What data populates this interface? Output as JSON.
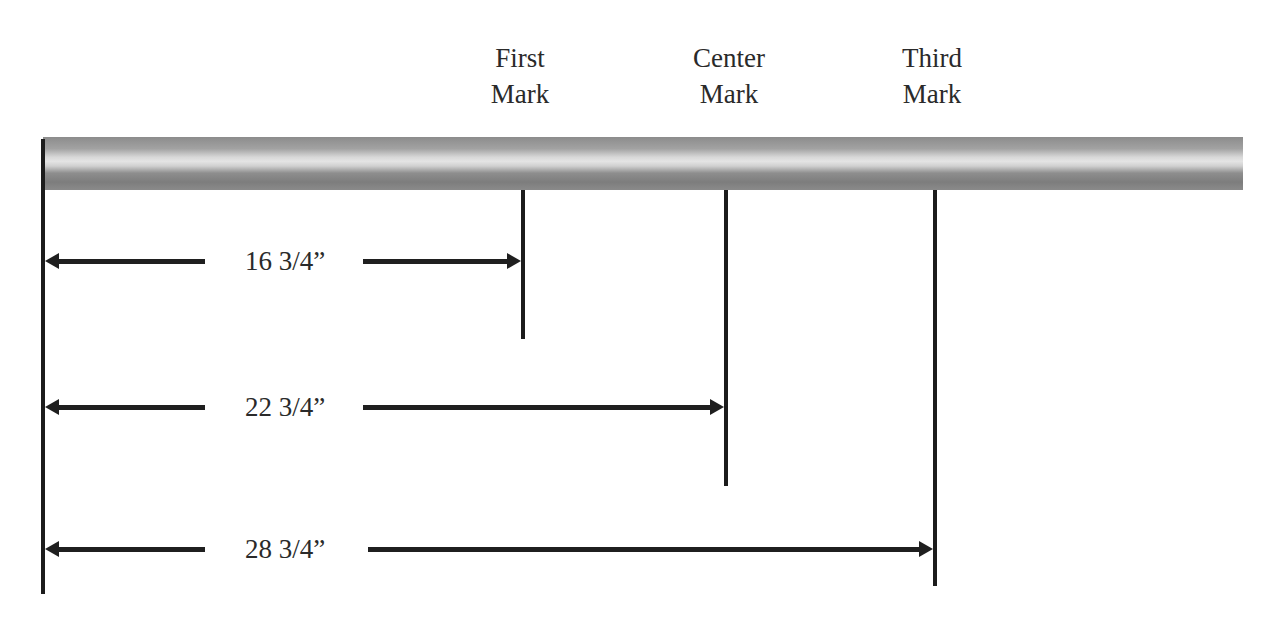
{
  "diagram": {
    "marks": [
      {
        "label_line1": "First",
        "label_line2": "Mark",
        "distance": "16 3/4”"
      },
      {
        "label_line1": "Center",
        "label_line2": "Mark",
        "distance": "22 3/4”"
      },
      {
        "label_line1": "Third",
        "label_line2": "Mark",
        "distance": "28 3/4”"
      }
    ]
  }
}
